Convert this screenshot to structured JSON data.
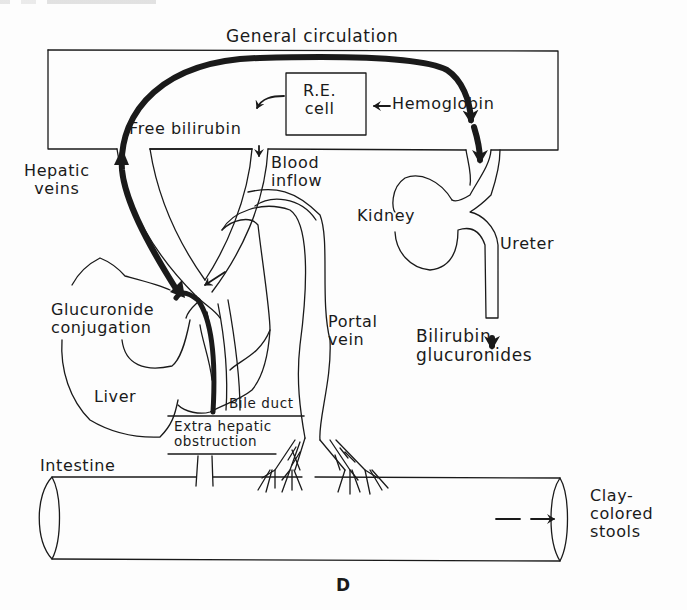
{
  "figure": {
    "panel_letter": "D",
    "colors": {
      "ink": "#1a1a1a",
      "paper": "#fdfdfd"
    }
  },
  "labels": {
    "general_circulation": "General circulation",
    "re_cell": "R.E.\ncell",
    "hemoglobin": "Hemoglobin",
    "free_bilirubin": "Free bilirubin",
    "hepatic_veins": "Hepatic\nveins",
    "blood_inflow": "Blood\ninflow",
    "kidney": "Kidney",
    "ureter": "Ureter",
    "bilirubin_glucuronides": "Bilirubin\nglucuronides",
    "glucuronide_conjugation": "Glucuronide\nconjugation",
    "portal_vein": "Portal\nvein",
    "liver": "Liver",
    "bile_duct": "Bile duct",
    "extra_hepatic_obstruction": "Extra hepatic\nobstruction",
    "intestine": "Intestine",
    "clay_colored_stools": "Clay-\ncolored\nstools"
  },
  "flows": [
    {
      "from": "Hemoglobin",
      "to": "R.E. cell",
      "style": "thin-arrow"
    },
    {
      "from": "R.E. cell",
      "to": "Free bilirubin",
      "style": "thin-arrow"
    },
    {
      "from": "Free bilirubin",
      "to": "Liver (Glucuronide conjugation)",
      "via": "Blood inflow",
      "style": "thin-arrow"
    },
    {
      "from": "Bile duct (obstructed)",
      "to": "General circulation",
      "via": "Hepatic veins",
      "style": "thick-arrow"
    },
    {
      "from": "General circulation",
      "to": "Kidney",
      "style": "thick-arrow"
    },
    {
      "from": "Kidney",
      "to": "Bilirubin glucuronides",
      "via": "Ureter",
      "style": "thick-arrow"
    },
    {
      "from": "Intestine",
      "to": "Clay-colored stools",
      "style": "thin-arrow"
    }
  ]
}
